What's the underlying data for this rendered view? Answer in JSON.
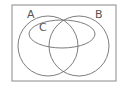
{
  "diagram": {
    "type": "venn",
    "colors": {
      "stroke": "#6e6e6e",
      "frame": "#8a8a8a",
      "label": "#555555",
      "background": "#ffffff"
    },
    "universe": {
      "x": 12,
      "y": 5,
      "width": 104,
      "height": 76
    },
    "sets": [
      {
        "label": "A",
        "shape": "circle",
        "cx": 48,
        "cy": 46,
        "r": 30,
        "label_x": 27,
        "label_y": 18
      },
      {
        "label": "B",
        "shape": "circle",
        "cx": 79,
        "cy": 46,
        "r": 30,
        "label_x": 95,
        "label_y": 18
      },
      {
        "label": "C",
        "shape": "ellipse",
        "cx": 62,
        "cy": 34,
        "rx": 33,
        "ry": 14,
        "label_x": 39,
        "label_y": 31
      }
    ]
  }
}
